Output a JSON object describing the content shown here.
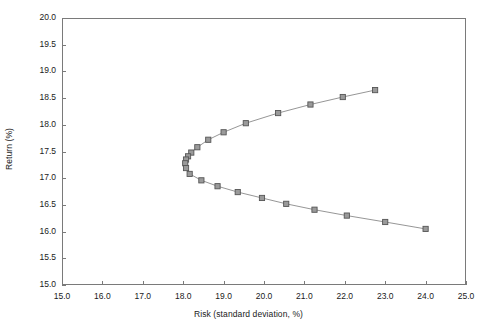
{
  "chart_data": {
    "type": "line",
    "title": "",
    "subtitle": "",
    "xlabel": "Risk (standard deviation, %)",
    "ylabel": "Return (%)",
    "xlim": [
      15.0,
      25.0
    ],
    "ylim": [
      15.0,
      20.0
    ],
    "xticks": [
      "15.0",
      "16.0",
      "17.0",
      "18.0",
      "19.0",
      "20.0",
      "21.0",
      "22.0",
      "23.0",
      "24.0",
      "25.0"
    ],
    "yticks": [
      "15.0",
      "15.5",
      "16.0",
      "16.5",
      "17.0",
      "17.5",
      "18.0",
      "18.5",
      "19.0",
      "19.5",
      "20.0"
    ],
    "xtick_values": [
      15.0,
      16.0,
      17.0,
      18.0,
      19.0,
      20.0,
      21.0,
      22.0,
      23.0,
      24.0,
      25.0
    ],
    "ytick_values": [
      15.0,
      15.5,
      16.0,
      16.5,
      17.0,
      17.5,
      18.0,
      18.5,
      19.0,
      19.5,
      20.0
    ],
    "grid": false,
    "legend": false,
    "legend_position": "none",
    "marker": "open-square",
    "marker_color": "#9a9a9a",
    "marker_edge_color": "#555555",
    "line_color": "#8a8a8a",
    "frame_color": "#7a7a7a",
    "annotations": [],
    "series": [
      {
        "name": "Efficient frontier",
        "points": [
          {
            "x": 22.75,
            "y": 18.65
          },
          {
            "x": 21.95,
            "y": 18.52
          },
          {
            "x": 21.15,
            "y": 18.38
          },
          {
            "x": 20.35,
            "y": 18.22
          },
          {
            "x": 19.55,
            "y": 18.03
          },
          {
            "x": 19.0,
            "y": 17.86
          },
          {
            "x": 18.62,
            "y": 17.72
          },
          {
            "x": 18.35,
            "y": 17.58
          },
          {
            "x": 18.2,
            "y": 17.48
          },
          {
            "x": 18.12,
            "y": 17.41
          },
          {
            "x": 18.07,
            "y": 17.35
          },
          {
            "x": 18.05,
            "y": 17.28
          },
          {
            "x": 18.07,
            "y": 17.19
          },
          {
            "x": 18.16,
            "y": 17.08
          },
          {
            "x": 18.45,
            "y": 16.96
          },
          {
            "x": 18.85,
            "y": 16.85
          },
          {
            "x": 19.35,
            "y": 16.74
          },
          {
            "x": 19.95,
            "y": 16.63
          },
          {
            "x": 20.55,
            "y": 16.52
          },
          {
            "x": 21.25,
            "y": 16.41
          },
          {
            "x": 22.05,
            "y": 16.3
          },
          {
            "x": 23.0,
            "y": 16.18
          },
          {
            "x": 24.0,
            "y": 16.05
          }
        ]
      }
    ]
  },
  "plot_area": {
    "left": 62,
    "top": 18,
    "right": 466,
    "bottom": 285
  }
}
